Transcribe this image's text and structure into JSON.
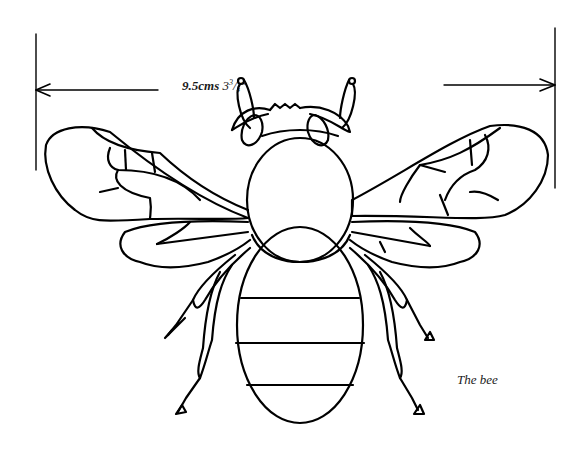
{
  "figure": {
    "subject": "bee",
    "caption": "The bee",
    "measurement": {
      "metric": "9.5cms",
      "imperial_whole": "3",
      "imperial_num": "3",
      "imperial_den": "4",
      "imperial_unit": "″"
    },
    "colors": {
      "ink": "#000000",
      "background": "#ffffff"
    }
  }
}
